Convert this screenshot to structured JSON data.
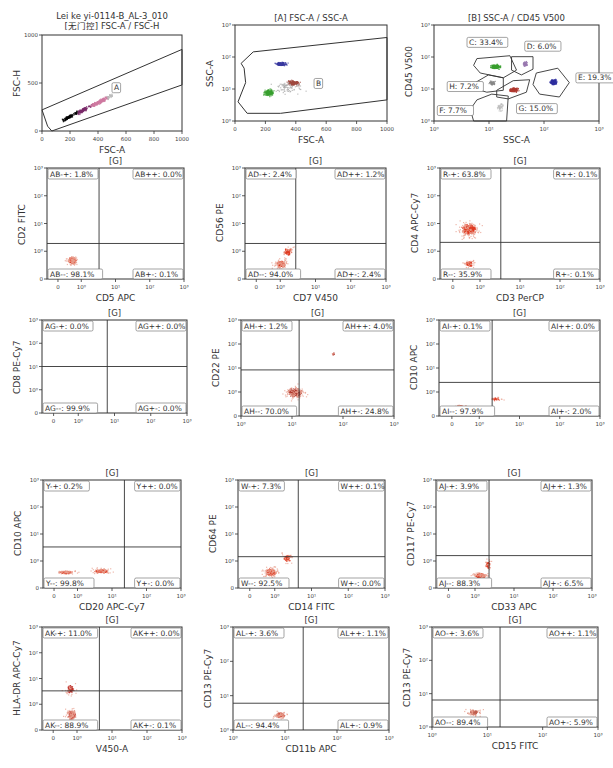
{
  "chart_data": [
    {
      "id": "p1",
      "type": "scatter",
      "title": "Lei ke yi-0114-B_AL-3_010",
      "subtitle": "[无门控] FSC-A / FSC-H",
      "xlabel": "FSC-A",
      "ylabel": "FSC-H",
      "scale": "linear",
      "xlim": [
        0,
        1000
      ],
      "ylim": [
        0,
        1000
      ],
      "xticks": [
        "0",
        "200",
        "400",
        "600",
        "800",
        "1000"
      ],
      "yticks": [
        "0",
        "500",
        "1000"
      ],
      "gates": [
        {
          "name": "A",
          "label": "A"
        }
      ],
      "populations": [
        {
          "color": "#000000",
          "x": 230,
          "y": 160
        },
        {
          "color": "#7a2a6a",
          "x": 330,
          "y": 230
        },
        {
          "color": "#d07aa0",
          "x": 430,
          "y": 300
        }
      ]
    },
    {
      "id": "p2",
      "type": "scatter",
      "title": "[A] FSC-A / SSC-A",
      "xlabel": "FSC-A",
      "ylabel": "SSC-A",
      "scale": "linear-x log-y",
      "xlim": [
        0,
        1000
      ],
      "ylim": [
        -1,
        3
      ],
      "xticks": [
        "0",
        "200",
        "400",
        "600",
        "800",
        "1000"
      ],
      "yticks": [
        "10^0",
        "10^1",
        "10^2",
        "10^3"
      ],
      "gates": [
        {
          "name": "B",
          "label": "B"
        }
      ],
      "populations": [
        {
          "color": "#3a3aa0",
          "x": 300,
          "y": 1.3
        },
        {
          "color": "#3aa030",
          "x": 250,
          "y": 0.2
        },
        {
          "color": "#a04a40",
          "x": 380,
          "y": 0.7
        }
      ]
    },
    {
      "id": "p3",
      "type": "scatter",
      "title": "[B] SSC-A / CD45 V500",
      "xlabel": "SSC-A",
      "ylabel": "CD45 V500",
      "scale": "log",
      "xticks": [
        "10^0",
        "10^1",
        "10^2",
        "10^3"
      ],
      "yticks": [
        "10^0",
        "10^1",
        "10^2",
        "10^3"
      ],
      "gates": [
        {
          "name": "C",
          "label": "C: 33.4%",
          "value": 33.4,
          "color": "#3aa030"
        },
        {
          "name": "D",
          "label": "D: 6.0%",
          "value": 6.0,
          "color": "#9a7ab0"
        },
        {
          "name": "E",
          "label": "E: 19.3%",
          "value": 19.3,
          "color": "#3030a0"
        },
        {
          "name": "F",
          "label": "F: 7.7%",
          "value": 7.7,
          "color": "#bbbbbb"
        },
        {
          "name": "G",
          "label": "G: 15.0%",
          "value": 15.0,
          "color": "#b03a30"
        },
        {
          "name": "H",
          "label": "H: 7.2%",
          "value": 7.2,
          "color": "#888888"
        }
      ]
    },
    {
      "id": "p4",
      "type": "scatter",
      "title": "[G]",
      "xlabel": "CD5 APC",
      "ylabel": "CD2 FITC",
      "xticks": [
        "0",
        "10^0",
        "10^1",
        "10^2",
        "10^3"
      ],
      "yticks": [
        "0",
        "10^0",
        "10^1",
        "10^2",
        "10^3"
      ],
      "quadrants": {
        "ul": "AB-+: 1.8%",
        "ur": "AB++: 0.0%",
        "ll": "AB--: 98.1%",
        "lr": "AB+-: 0.1%"
      },
      "values": {
        "ul": 1.8,
        "ur": 0.0,
        "ll": 98.1,
        "lr": 0.1
      },
      "color": "#e03a20"
    },
    {
      "id": "p5",
      "type": "scatter",
      "title": "[G]",
      "xlabel": "CD7 V450",
      "ylabel": "CD56 PE",
      "xticks": [
        "0",
        "10^0",
        "10^1",
        "10^2",
        "10^3"
      ],
      "yticks": [
        "0",
        "10^0",
        "10^1",
        "10^2",
        "10^3"
      ],
      "quadrants": {
        "ul": "AD-+: 2.4%",
        "ur": "AD++: 1.2%",
        "ll": "AD--: 94.0%",
        "lr": "AD+-: 2.4%"
      },
      "values": {
        "ul": 2.4,
        "ur": 1.2,
        "ll": 94.0,
        "lr": 2.4
      },
      "color": "#e03a20"
    },
    {
      "id": "p6",
      "type": "scatter",
      "title": "[G]",
      "xlabel": "CD3 PerCP",
      "ylabel": "CD4 APC-Cy7",
      "xticks": [
        "0",
        "10^0",
        "10^1",
        "10^2",
        "10^3"
      ],
      "yticks": [
        "0",
        "10^0",
        "10^1",
        "10^2",
        "10^3"
      ],
      "quadrants": {
        "ul": "R-+: 63.8%",
        "ur": "R++: 0.1%",
        "ll": "R--: 35.9%",
        "lr": "R+-: 0.1%"
      },
      "values": {
        "ul": 63.8,
        "ur": 0.1,
        "ll": 35.9,
        "lr": 0.1
      },
      "color": "#e03a20"
    },
    {
      "id": "p7",
      "type": "scatter",
      "title": "[G]",
      "xlabel": "",
      "ylabel": "CD8 PE-Cy7",
      "xticks": [
        "0",
        "10^0",
        "10^1",
        "10^2",
        "10^3"
      ],
      "yticks": [
        "0",
        "10^0",
        "10^1",
        "10^2",
        "10^3"
      ],
      "quadrants": {
        "ul": "AG-+: 0.0%",
        "ur": "AG++: 0.0%",
        "ll": "AG--: 99.9%",
        "lr": "AG+-: 0.0%"
      },
      "values": {
        "ul": 0.0,
        "ur": 0.0,
        "ll": 99.9,
        "lr": 0.0
      },
      "color": "#e03a20"
    },
    {
      "id": "p8",
      "type": "scatter",
      "title": "[G]",
      "xlabel": "",
      "ylabel": "CD22 PE",
      "xticks": [
        "10^0",
        "10^1",
        "10^2",
        "10^3"
      ],
      "yticks": [
        "0",
        "10^0",
        "10^1",
        "10^2",
        "10^3"
      ],
      "quadrants": {
        "ul": "AH-+: 1.2%",
        "ur": "AH++: 4.0%",
        "ll": "AH--: 70.0%",
        "lr": "AH+-: 24.8%"
      },
      "values": {
        "ul": 1.2,
        "ur": 4.0,
        "ll": 70.0,
        "lr": 24.8
      },
      "color": "#b03a30"
    },
    {
      "id": "p9",
      "type": "scatter",
      "title": "[G]",
      "xlabel": "",
      "ylabel": "CD10 APC",
      "xticks": [
        "0",
        "10^0",
        "10^1",
        "10^2",
        "10^3"
      ],
      "yticks": [
        "0",
        "10^0",
        "10^1",
        "10^2",
        "10^3"
      ],
      "quadrants": {
        "ul": "AI-+: 0.1%",
        "ur": "AI++: 0.0%",
        "ll": "AI--: 97.9%",
        "lr": "AI+-: 2.0%"
      },
      "values": {
        "ul": 0.1,
        "ur": 0.0,
        "ll": 97.9,
        "lr": 2.0
      },
      "color": "#e03a20"
    },
    {
      "id": "p10",
      "type": "scatter",
      "title": "[G]",
      "xlabel": "CD20 APC-Cy7",
      "ylabel": "CD10 APC",
      "xticks": [
        "0",
        "10^0",
        "10^1",
        "10^2",
        "10^3"
      ],
      "yticks": [
        "0",
        "10^0",
        "10^1",
        "10^2",
        "10^3"
      ],
      "quadrants": {
        "ul": "Y-+: 0.2%",
        "ur": "Y++: 0.0%",
        "ll": "Y--: 99.8%",
        "lr": "Y+-: 0.0%"
      },
      "values": {
        "ul": 0.2,
        "ur": 0.0,
        "ll": 99.8,
        "lr": 0.0
      },
      "color": "#e03a20"
    },
    {
      "id": "p11",
      "type": "scatter",
      "title": "[G]",
      "xlabel": "CD14 FITC",
      "ylabel": "CD64 PE",
      "xticks": [
        "0",
        "10^0",
        "10^1",
        "10^2",
        "10^3"
      ],
      "yticks": [
        "0",
        "10^0",
        "10^1",
        "10^2",
        "10^3"
      ],
      "quadrants": {
        "ul": "W-+: 7.3%",
        "ur": "W++: 0.1%",
        "ll": "W--: 92.5%",
        "lr": "W+-: 0.0%"
      },
      "values": {
        "ul": 7.3,
        "ur": 0.1,
        "ll": 92.5,
        "lr": 0.0
      },
      "color": "#e03a20"
    },
    {
      "id": "p12",
      "type": "scatter",
      "title": "[G]",
      "xlabel": "CD33 APC",
      "ylabel": "CD117 PE-Cy7",
      "xticks": [
        "0",
        "10^0",
        "10^1",
        "10^2",
        "10^3"
      ],
      "yticks": [
        "0",
        "10^0",
        "10^1",
        "10^2",
        "10^3"
      ],
      "quadrants": {
        "ul": "AJ-+: 3.9%",
        "ur": "AJ++: 1.3%",
        "ll": "AJ--: 88.3%",
        "lr": "AJ+-: 6.5%"
      },
      "values": {
        "ul": 3.9,
        "ur": 1.3,
        "ll": 88.3,
        "lr": 6.5
      },
      "color": "#e03a20"
    },
    {
      "id": "p13",
      "type": "scatter",
      "title": "[G]",
      "xlabel": "V450-A",
      "ylabel": "HLA-DR APC-Cy7",
      "xticks": [
        "0",
        "10^0",
        "10^1",
        "10^2",
        "10^3"
      ],
      "yticks": [
        "0",
        "10^0",
        "10^1",
        "10^2",
        "10^3"
      ],
      "quadrants": {
        "ul": "AK-+: 11.0%",
        "ur": "AK++: 0.0%",
        "ll": "AK--: 88.9%",
        "lr": "AK+-: 0.1%"
      },
      "values": {
        "ul": 11.0,
        "ur": 0.0,
        "ll": 88.9,
        "lr": 0.1
      },
      "color": "#c0302a"
    },
    {
      "id": "p14",
      "type": "scatter",
      "title": "[G]",
      "xlabel": "CD11b APC",
      "ylabel": "CD13 PE-Cy7",
      "xticks": [
        "10^0",
        "10^1",
        "10^2",
        "10^3"
      ],
      "yticks": [
        "10^0",
        "10^1",
        "10^2",
        "10^3"
      ],
      "quadrants": {
        "ul": "AL-+: 3.6%",
        "ur": "AL++: 1.1%",
        "ll": "AL--: 94.4%",
        "lr": "AL+-: 0.9%"
      },
      "values": {
        "ul": 3.6,
        "ur": 1.1,
        "ll": 94.4,
        "lr": 0.9
      },
      "color": "#d05040"
    },
    {
      "id": "p15",
      "type": "scatter",
      "title": "[G]",
      "xlabel": "CD15 FITC",
      "ylabel": "CD13 PE-Cy7",
      "xticks": [
        "10^0",
        "10^1",
        "10^2",
        "10^3"
      ],
      "yticks": [
        "10^0",
        "10^1",
        "10^2",
        "10^3"
      ],
      "quadrants": {
        "ul": "AO-+: 3.6%",
        "ur": "AO++: 1.1%",
        "ll": "AO--: 89.4%",
        "lr": "AO+-: 5.9%"
      },
      "values": {
        "ul": 3.6,
        "ur": 1.1,
        "ll": 89.4,
        "lr": 5.9
      },
      "color": "#c06050"
    }
  ]
}
